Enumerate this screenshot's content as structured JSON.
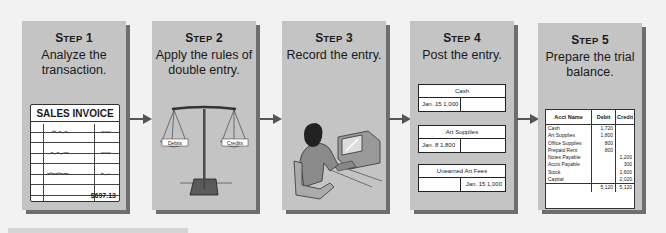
{
  "diagram": {
    "type": "accounting-cycle-flow",
    "steps": [
      {
        "label_first": "S",
        "label_rest": "TEP",
        "number": "1",
        "description": "Analyze the transaction.",
        "illustration": "sales-invoice",
        "invoice": {
          "title": "SALES INVOICE",
          "total": "$697.13"
        }
      },
      {
        "label_first": "S",
        "label_rest": "TEP",
        "number": "2",
        "description": "Apply the rules of double entry.",
        "illustration": "balance-scale",
        "scale": {
          "left_pan": "Debits",
          "right_pan": "Credits"
        }
      },
      {
        "label_first": "S",
        "label_rest": "TEP",
        "number": "3",
        "description": "Record the entry.",
        "illustration": "person-at-computer"
      },
      {
        "label_first": "S",
        "label_rest": "TEP",
        "number": "4",
        "description": "Post the entry.",
        "illustration": "t-accounts",
        "accounts": [
          {
            "name": "Cash",
            "debit": "Jan. 15  1,000",
            "credit": ""
          },
          {
            "name": "Art Supplies",
            "debit": "Jan.  8   1,800",
            "credit": ""
          },
          {
            "name": "Unearned Art Fees",
            "debit": "",
            "credit": "Jan. 15  1,000"
          }
        ]
      },
      {
        "label_first": "S",
        "label_rest": "TEP",
        "number": "5",
        "description": "Prepare the trial balance.",
        "illustration": "trial-balance",
        "trial_balance": {
          "headers": [
            "Acct Name",
            "Debit",
            "Credit"
          ],
          "rows": [
            [
              "Cash",
              "1,720",
              ""
            ],
            [
              "Art Supplies",
              "1,800",
              ""
            ],
            [
              "Office Supplies",
              "800",
              ""
            ],
            [
              "Prepaid Rent",
              "800",
              ""
            ],
            [
              "Notes Payable",
              "",
              "1,200"
            ],
            [
              "Accts Payable",
              "",
              "300"
            ],
            [
              "Stock",
              "",
              "1,600"
            ],
            [
              "Capital",
              "",
              "2,020"
            ]
          ],
          "totals": [
            "",
            "5,120",
            "5,120"
          ]
        }
      }
    ],
    "colors": {
      "panel": "#c4c4c4",
      "shadow": "#6e6e6e",
      "arrow": "#555555",
      "background": "#f2f2f2"
    }
  }
}
